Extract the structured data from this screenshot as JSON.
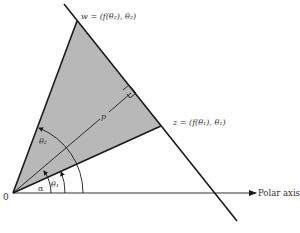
{
  "figure": {
    "type": "polar-coordinate-geometry",
    "colors": {
      "region_fill": "#b8b8b8",
      "line": "#1a1a1a",
      "text": "#333333",
      "background": "#ffffff"
    },
    "labels": {
      "origin": "0",
      "polar_axis": "Polar axis",
      "point_w": "w = (f(θ₂), θ₂)",
      "point_z": "z = (f(θ₁), θ₁)",
      "perpendicular": "p",
      "angle_alpha": "α",
      "angle_theta1": "θ₁",
      "angle_theta2": "θ₂"
    },
    "elements": [
      {
        "name": "shaded-triangle",
        "vertices": [
          "O",
          "w",
          "z"
        ]
      },
      {
        "name": "line-through-w-z",
        "note": "straight line extending beyond w and z"
      },
      {
        "name": "perpendicular-segment-p",
        "from": "O",
        "to": "foot on line w-z",
        "right_angle_marker": true
      },
      {
        "name": "angle-arc-alpha",
        "from": "polar axis",
        "to": "p"
      },
      {
        "name": "angle-arc-theta1",
        "from": "polar axis",
        "to": "Oz"
      },
      {
        "name": "angle-arc-theta2",
        "from": "polar axis",
        "to": "Ow"
      }
    ]
  }
}
